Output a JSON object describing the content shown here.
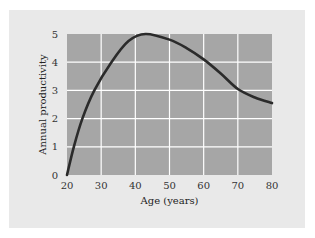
{
  "chart_data": {
    "type": "line",
    "title": "",
    "xlabel": "Age (years)",
    "ylabel": "Annual productivity",
    "xlim": [
      20,
      80
    ],
    "ylim": [
      0,
      5
    ],
    "xticks": [
      20,
      30,
      40,
      50,
      60,
      70,
      80
    ],
    "yticks": [
      0,
      1,
      2,
      3,
      4,
      5
    ],
    "grid": true,
    "legend": null,
    "series": [
      {
        "name": "Annual productivity",
        "x": [
          20,
          22,
          24.5,
          28,
          33,
          38,
          43,
          50,
          55,
          60,
          65,
          70,
          75,
          80
        ],
        "y": [
          0,
          1.0,
          2.0,
          3.0,
          4.0,
          4.75,
          5.0,
          4.8,
          4.5,
          4.1,
          3.6,
          3.05,
          2.75,
          2.55
        ]
      }
    ]
  },
  "colors": {
    "panel_bg": "#e9e9e9",
    "plot_bg": "#a6a6a6",
    "grid": "#ffffff",
    "line": "#2b2b2b"
  }
}
